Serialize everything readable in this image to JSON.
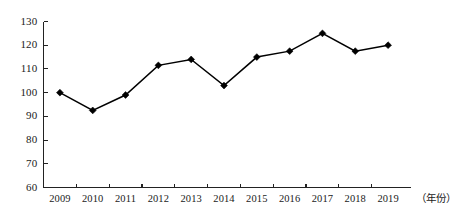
{
  "chart_data": {
    "type": "line",
    "title": "",
    "xlabel": "（年份）",
    "ylabel": "",
    "categories": [
      "2009",
      "2010",
      "2011",
      "2012",
      "2013",
      "2014",
      "2015",
      "2016",
      "2017",
      "2018",
      "2019"
    ],
    "values": [
      100,
      92.5,
      99,
      111.5,
      114,
      103,
      115,
      117.5,
      125,
      117.5,
      120
    ],
    "series": [
      {
        "name": "",
        "values": [
          100,
          92.5,
          99,
          111.5,
          114,
          103,
          115,
          117.5,
          125,
          117.5,
          120
        ]
      }
    ],
    "ylim": [
      60,
      130
    ],
    "yticks": [
      60,
      70,
      80,
      90,
      100,
      110,
      120,
      130
    ],
    "ytick_labels": [
      "60",
      "70",
      "80",
      "90",
      "100",
      "110",
      "120",
      "130"
    ],
    "grid": false,
    "legend": false,
    "legend_position": "none",
    "marker": "diamond",
    "line_color": "#000000",
    "marker_color": "#000000",
    "axis_color": "#222222",
    "background_color": "#ffffff"
  },
  "axes": {
    "x_axis_name": "year-axis",
    "y_axis_name": "value-axis"
  }
}
